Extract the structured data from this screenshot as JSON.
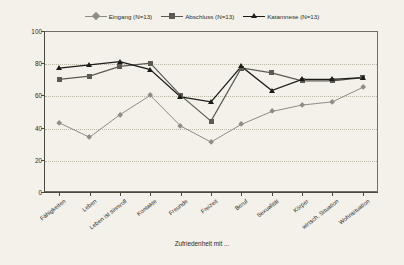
{
  "chart_data": {
    "type": "line",
    "title": "",
    "xlabel": "Zufriedenheit mit ...",
    "ylabel": "",
    "ylim": [
      0,
      100
    ],
    "yticks": [
      0,
      20,
      40,
      60,
      80,
      100
    ],
    "grid": true,
    "legend_position": "top",
    "categories": [
      "Fähigkeiten",
      "Leben",
      "Leben ist sinnvoll",
      "Kontakte",
      "Freunde",
      "Freizeit",
      "Beruf",
      "Sexualität",
      "Körper",
      "wirtsch. Situation",
      "Wohnsituation"
    ],
    "series": [
      {
        "name": "Eingang (N=13)",
        "label": "Eingang (N=13)",
        "color": "#8d8d85",
        "marker": "diamond",
        "values": [
          43,
          34,
          48,
          60,
          41,
          31,
          42,
          50,
          54,
          56,
          65
        ]
      },
      {
        "name": "Abschluss (N=13)",
        "label": "Abschluss (N=13)",
        "color": "#5a5a52",
        "marker": "square",
        "values": [
          70,
          72,
          78,
          80,
          60,
          44,
          77,
          74,
          69,
          69,
          71
        ]
      },
      {
        "name": "Katamnese (N=13)",
        "label": "Katamnese (N=13)",
        "color": "#1c1c18",
        "marker": "triangle",
        "values": [
          77,
          79,
          81,
          76,
          59,
          56,
          78,
          63,
          70,
          70,
          71
        ]
      }
    ]
  },
  "colors": {
    "background": "#f3f1ea",
    "frame": "#6f6f63",
    "grid": "#b9b6a8",
    "text": "#2b2b2b"
  }
}
